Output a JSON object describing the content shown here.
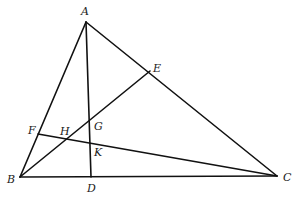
{
  "figure": {
    "type": "geometry",
    "points": {
      "A": {
        "label": "A",
        "x": 86,
        "y": 22,
        "lx": 81,
        "ly": 15
      },
      "B": {
        "label": "B",
        "x": 20,
        "y": 177,
        "lx": 7,
        "ly": 183
      },
      "C": {
        "label": "C",
        "x": 277,
        "y": 176,
        "lx": 283,
        "ly": 181
      },
      "D": {
        "label": "D",
        "x": 91,
        "y": 177,
        "lx": 87,
        "ly": 192
      },
      "E": {
        "label": "E",
        "x": 150,
        "y": 71,
        "lx": 153,
        "ly": 72
      },
      "F": {
        "label": "F",
        "x": 38,
        "y": 134,
        "lx": 28,
        "ly": 134
      },
      "G": {
        "label": "G",
        "x": 89,
        "y": 128,
        "lx": 94,
        "ly": 130
      },
      "H": {
        "label": "H",
        "x": 66,
        "y": 139,
        "lx": 60,
        "ly": 135
      },
      "K": {
        "label": "K",
        "x": 90,
        "y": 144,
        "lx": 94,
        "ly": 156
      }
    },
    "segments": [
      [
        "A",
        "B"
      ],
      [
        "B",
        "C"
      ],
      [
        "C",
        "A"
      ],
      [
        "A",
        "D"
      ],
      [
        "B",
        "E"
      ],
      [
        "F",
        "C"
      ]
    ],
    "line_color": "#111111"
  }
}
